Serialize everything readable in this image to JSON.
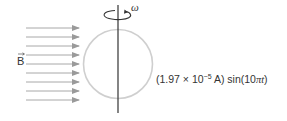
{
  "diagram": {
    "field_label": "B",
    "field_label_vector": true,
    "rotation_label": "ω",
    "arrow_count": 9,
    "arrow_rows_y": [
      28,
      37,
      46,
      55,
      64,
      73,
      82,
      91,
      100
    ],
    "current_expression": {
      "prefix": "(1.97 × 10",
      "exponent": "−5",
      "unit_suffix": " A) sin(10",
      "pi": "π",
      "t": "t",
      "close": ")"
    },
    "colors": {
      "arrows": "#9a9a9a",
      "loop": "#c8c8c8",
      "axis": "#333333",
      "text": "#333333"
    }
  }
}
